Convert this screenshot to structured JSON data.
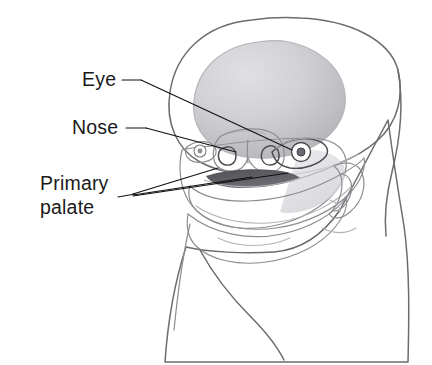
{
  "figure": {
    "background_color": "#ffffff",
    "style": "grayscale pencil-shaded medical illustration",
    "width": 432,
    "height": 365
  },
  "labels": [
    {
      "id": "eye",
      "text": "Eye",
      "text_x": 82,
      "text_y": 86,
      "dash_x1": 122,
      "dash_y1": 80,
      "dash_x2": 141,
      "dash_y2": 80,
      "leader_x1": 141,
      "leader_y1": 80,
      "leader_x2": 288,
      "leader_y2": 148,
      "pointer_count": 1,
      "color": "#111111"
    },
    {
      "id": "nose",
      "text": "Nose",
      "text_x": 72,
      "text_y": 134,
      "dash_x1": 126,
      "dash_y1": 128,
      "dash_x2": 146,
      "dash_y2": 128,
      "leader_x1": 146,
      "leader_y1": 128,
      "leader_x2": 234,
      "leader_y2": 152,
      "pointer_count": 1,
      "color": "#111111"
    },
    {
      "id": "primary-palate",
      "text_line1": "Primary",
      "text_line2": "palate",
      "text_x": 40,
      "text_y1": 190,
      "text_y2": 214,
      "dash_x1": 122,
      "dash_y1": 196,
      "dash_x2": 135,
      "dash_y2": 194,
      "converge_x": 134,
      "converge_y": 194,
      "pointer_count": 3,
      "targets": [
        {
          "x": 215,
          "y": 170
        },
        {
          "x": 250,
          "y": 176
        },
        {
          "x": 282,
          "y": 174
        }
      ],
      "color": "#111111"
    }
  ],
  "anatomy": {
    "regions": [
      {
        "id": "cranium",
        "name": "cranial vault",
        "tone": "#f2f2f3"
      },
      {
        "id": "forebrain-shadow",
        "name": "forebrain prominence shading",
        "tone": "#c9c9cc"
      },
      {
        "id": "frontonasal-prominence",
        "name": "frontonasal prominence",
        "tone": "#d8d8db"
      },
      {
        "id": "nose",
        "name": "nasal prominence",
        "tone": "#c2c2c6"
      },
      {
        "id": "eye-right",
        "name": "right eye",
        "tone": "#ffffff"
      },
      {
        "id": "eye-left",
        "name": "left eye (far side)",
        "tone": "#ffffff"
      },
      {
        "id": "primary-palate",
        "name": "primary palate / upper lip band",
        "tone": "#9a9aa0"
      },
      {
        "id": "oral-cavity",
        "name": "oral cavity shadow",
        "tone": "#5d5d63"
      },
      {
        "id": "mandible",
        "name": "mandibular arch",
        "tone": "#f4f4f5"
      },
      {
        "id": "ear",
        "name": "external ear",
        "tone": "#e4e4e7"
      },
      {
        "id": "neck",
        "name": "neck",
        "tone": "#f6f6f7"
      }
    ]
  }
}
